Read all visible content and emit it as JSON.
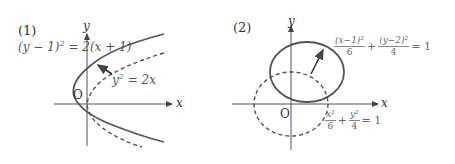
{
  "panels": [
    {
      "label": "(1)",
      "axes": {
        "x_label": "x",
        "y_label": "y",
        "origin_label": "O"
      },
      "curves": [
        {
          "name": "shifted-parabola",
          "equation": "(y − 1)² = 2(x + 1)",
          "style": "solid"
        },
        {
          "name": "base-parabola",
          "equation": "y² = 2x",
          "style": "dashed"
        }
      ],
      "equation_labels": {
        "solid_lhs": "(y − 1)",
        "solid_rhs": " = 2(x + 1)",
        "dashed_lhs": "y",
        "dashed_rhs": " = 2x",
        "sup": "2"
      },
      "arrow": "translation from dashed to solid curve"
    },
    {
      "label": "(2)",
      "axes": {
        "x_label": "x",
        "y_label": "y",
        "origin_label": "O"
      },
      "curves": [
        {
          "name": "shifted-ellipse",
          "equation": "(x−1)²/6 + (y−2)²/4 = 1",
          "style": "solid"
        },
        {
          "name": "base-ellipse",
          "equation": "x²/6 + y²/4 = 1",
          "style": "dashed"
        }
      ],
      "equation_labels": {
        "solid_num1": "(x−1)²",
        "solid_den1": "6",
        "solid_num2": "(y−2)²",
        "solid_den2": "4",
        "dashed_num1": "x²",
        "dashed_den1": "6",
        "dashed_num2": "y²",
        "dashed_den2": "4",
        "plus": "+",
        "equals_one": "= 1"
      },
      "arrow": "translation from dashed to solid curve"
    }
  ],
  "colors": {
    "curve": "#555555",
    "axis": "#555555",
    "text": "#444444"
  }
}
